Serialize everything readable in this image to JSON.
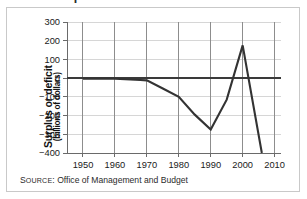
{
  "figure": {
    "title_clipped": "Federal Surplus or Deficit",
    "source_prefix_lead": "S",
    "source_prefix_rest": "OURCE",
    "source_separator": ": ",
    "source_text": "Office of Management and Budget",
    "frame_color": "#c9c9c9",
    "background_color": "#ffffff"
  },
  "chart_data": {
    "type": "line",
    "title": "Federal Surplus or Deficit",
    "xlabel": "",
    "ylabel": "Surplus or deficit",
    "ylabel_sub": "(billions of dollars)",
    "xlim": [
      1945,
      2012
    ],
    "ylim": [
      -400,
      300
    ],
    "xticks": [
      1950,
      1960,
      1970,
      1980,
      1990,
      2000,
      2010
    ],
    "xtick_labels": [
      "1950",
      "1960",
      "1970",
      "1980",
      "1990",
      "2000",
      "2010"
    ],
    "yticks": [
      300,
      200,
      100,
      0,
      -100,
      -200,
      -300,
      -400
    ],
    "ytick_labels": [
      "300",
      "200",
      "100",
      "0",
      "−100",
      "−200",
      "−300",
      "−400"
    ],
    "grid": true,
    "grid_color": "#d6d6d6",
    "grid_vertical_color": "#8d8d8d",
    "zero_line_color": "#3a3a3a",
    "legend": null,
    "series": [
      {
        "name": "Surplus or deficit",
        "color": "#333333",
        "x": [
          1950,
          1960,
          1968,
          1970,
          1975,
          1980,
          1985,
          1990,
          1995,
          2000,
          2006
        ],
        "values": [
          -3,
          -3,
          -10,
          -12,
          -55,
          -100,
          -195,
          -275,
          -115,
          175,
          -400
        ]
      }
    ],
    "annotations": [
      {
        "label": "trough",
        "x": 1990,
        "y": -275
      },
      {
        "label": "peak",
        "x": 2000,
        "y": 175
      },
      {
        "label": "endpoint",
        "x": 2006,
        "y": -400
      }
    ]
  },
  "axis": {
    "y_unit": "billions of dollars"
  }
}
